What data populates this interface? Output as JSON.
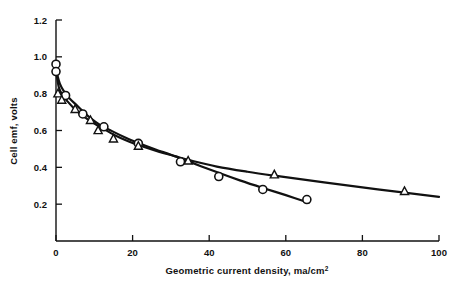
{
  "chart_data": {
    "type": "line",
    "title": "",
    "xlabel": "Geometric current density, ma/cm2",
    "xlabel_base": "Geometric current density, ma/cm",
    "xlabel_exponent": "2",
    "ylabel": "Cell emf, volts",
    "xlim": [
      0,
      100
    ],
    "ylim": [
      0,
      1.2
    ],
    "xticks": [
      0,
      20,
      40,
      60,
      80,
      100
    ],
    "xtick_labels": [
      "0",
      "20",
      "40",
      "60",
      "80",
      "100"
    ],
    "yticks": [
      0.2,
      0.4,
      0.6,
      0.8,
      1.0,
      1.2
    ],
    "ytick_labels": [
      "0.2",
      "0.4",
      "0.6",
      "0.8",
      "1.0",
      "1.2"
    ],
    "grid": false,
    "legend": "none",
    "series": [
      {
        "name": "circle-series",
        "marker": "circle",
        "x": [
          0,
          0,
          2.5,
          7,
          12.5,
          21.5,
          32.5,
          42.5,
          54,
          65.5
        ],
        "y": [
          0.96,
          0.92,
          0.79,
          0.69,
          0.62,
          0.53,
          0.43,
          0.35,
          0.28,
          0.225
        ],
        "line_x": [
          0.3,
          1.0,
          2.0,
          3.5,
          5.5,
          8.0,
          11.0,
          14.5,
          18.5,
          22.0,
          26.0,
          30.0,
          34.0,
          38.0,
          43.0,
          48.0,
          54.0,
          60.0,
          66.0
        ],
        "line_y": [
          0.905,
          0.855,
          0.815,
          0.775,
          0.735,
          0.685,
          0.637,
          0.598,
          0.558,
          0.528,
          0.497,
          0.468,
          0.437,
          0.405,
          0.366,
          0.329,
          0.288,
          0.249,
          0.208
        ]
      },
      {
        "name": "triangle-series",
        "marker": "triangle",
        "x": [
          0.5,
          1.5,
          5,
          9,
          11,
          15,
          21.5,
          34.5,
          57,
          91
        ],
        "y": [
          0.8,
          0.765,
          0.715,
          0.655,
          0.6,
          0.555,
          0.515,
          0.435,
          0.36,
          0.27
        ],
        "line_x": [
          0.2,
          0.8,
          1.8,
          3.0,
          5.0,
          7.0,
          9.5,
          12.0,
          15.5,
          19.0,
          22.0,
          27.0,
          31.0,
          35.0,
          42.0,
          50.0,
          58.0,
          70.0,
          84.0,
          100.0
        ],
        "line_y": [
          0.9,
          0.83,
          0.79,
          0.758,
          0.714,
          0.68,
          0.645,
          0.614,
          0.573,
          0.54,
          0.517,
          0.484,
          0.461,
          0.438,
          0.404,
          0.376,
          0.352,
          0.318,
          0.28,
          0.24
        ]
      }
    ]
  },
  "colors": {
    "ink": "#111111",
    "paper": "#ffffff"
  }
}
